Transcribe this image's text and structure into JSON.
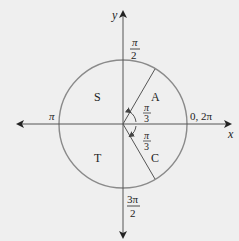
{
  "diagram": {
    "type": "unit-circle-quadrants",
    "axes": {
      "x_label": "x",
      "y_label": "y"
    },
    "angle_labels": {
      "top": {
        "num": "π",
        "den": "2"
      },
      "left": "π",
      "right": "0, 2π",
      "bottom": {
        "num": "3π",
        "den": "2"
      }
    },
    "quadrants": {
      "q1": "A",
      "q2": "S",
      "q3": "T",
      "q4": "C"
    },
    "reference_angles": [
      {
        "num": "π",
        "den": "3",
        "position": "above-x-axis"
      },
      {
        "num": "π",
        "den": "3",
        "position": "below-x-axis"
      }
    ],
    "colors": {
      "background": "#efefef",
      "circle": "#7a7a7a",
      "axis": "#555555",
      "text": "#222222"
    }
  }
}
